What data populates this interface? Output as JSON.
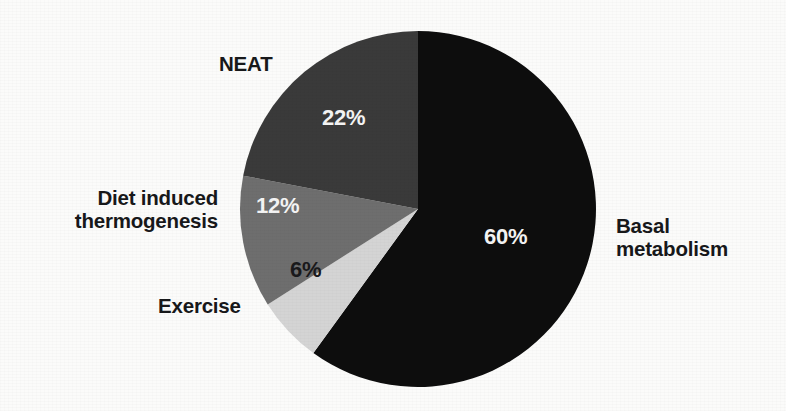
{
  "chart_data": {
    "type": "pie",
    "title": "",
    "subtitle": "",
    "xlabel": "",
    "ylabel": "",
    "legend_position": "none",
    "grid": false,
    "unit": "%",
    "total": 100,
    "start_angle_deg": 0,
    "direction": "clockwise",
    "center": {
      "x": 418,
      "y": 209,
      "radius": 178
    },
    "categories": [
      "Basal metabolism",
      "Exercise",
      "Diet induced thermogenesis",
      "NEAT"
    ],
    "values": [
      60,
      6,
      12,
      22
    ],
    "slices": [
      {
        "name": "Basal metabolism",
        "label": "Basal\nmetabolism",
        "label_line1": "Basal",
        "label_line2": "metabolism",
        "value": 60,
        "value_text": "60%",
        "color": "#0d0d0d",
        "value_text_color": "#f4f4f4",
        "start_deg": 0,
        "end_deg": 216
      },
      {
        "name": "Exercise",
        "label": "Exercise",
        "value": 6,
        "value_text": "6%",
        "color": "#d4d4d4",
        "value_text_color": "#19191b",
        "start_deg": 216,
        "end_deg": 237.6
      },
      {
        "name": "Diet induced thermogenesis",
        "label": "Diet induced\nthermogenesis",
        "label_line1": "Diet induced",
        "label_line2": "thermogenesis",
        "value": 12,
        "value_text": "12%",
        "color": "#6e6e6e",
        "value_text_color": "#f4f4f4",
        "start_deg": 237.6,
        "end_deg": 280.8
      },
      {
        "name": "NEAT",
        "label": "NEAT",
        "value": 22,
        "value_text": "22%",
        "color": "#3a3a3a",
        "value_text_color": "#f4f4f4",
        "start_deg": 280.8,
        "end_deg": 360
      }
    ],
    "colors": {
      "background": "#fbfbfa",
      "label_text": "#17181a",
      "basal_metabolism": "#0d0d0d",
      "exercise": "#d4d4d4",
      "diet_induced_thermogenesis": "#6e6e6e",
      "neat": "#3a3a3a"
    }
  }
}
